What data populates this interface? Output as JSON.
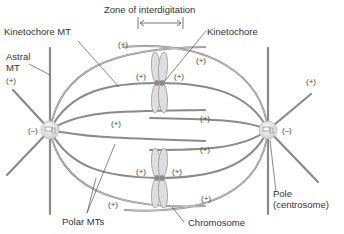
{
  "diagram": {
    "labels": {
      "zone": "Zone of interdigitation",
      "kinetochore_mt": "Kinetochore MT",
      "kinetochore": "Kinetochore",
      "astral_mt_line1": "Astral",
      "astral_mt_line2": "MT",
      "polar_mts": "Polar MTs",
      "chromosome": "Chromosome",
      "pole_line1": "Pole",
      "pole_line2": "(centrosome)"
    },
    "ends": {
      "plus": "(+)",
      "minus": "(–)"
    },
    "colors": {
      "mt": "#8a8a8a",
      "mt_light": "#cfcfcf",
      "chromosome_fill": "#dedede",
      "chromosome_stroke": "#9a9a9a",
      "centrosome": "#e8e8e8",
      "text": "#333333"
    }
  }
}
